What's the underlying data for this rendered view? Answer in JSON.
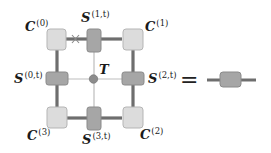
{
  "diagram": {
    "corners": [
      {
        "id": "C0",
        "base": "C",
        "sup": "(0)"
      },
      {
        "id": "C1",
        "base": "C",
        "sup": "(1)"
      },
      {
        "id": "C2",
        "base": "C",
        "sup": "(2)"
      },
      {
        "id": "C3",
        "base": "C",
        "sup": "(3)"
      }
    ],
    "edges": [
      {
        "id": "S0",
        "base": "S",
        "sup": "(0,t)"
      },
      {
        "id": "S1",
        "base": "S",
        "sup": "(1,t)"
      },
      {
        "id": "S2",
        "base": "S",
        "sup": "(2,t)"
      },
      {
        "id": "S3",
        "base": "S",
        "sup": "(3,t)"
      }
    ],
    "center": {
      "id": "T",
      "label": "T"
    },
    "equals": "=",
    "cross_mark": "×",
    "colors": {
      "corner_fill": "#dcdcdc",
      "corner_stroke": "#b5b5b5",
      "edge_fill": "#a6a6a6",
      "edge_stroke": "#8a8a8a",
      "thick_line": "#6e6e6e",
      "thin_line": "#bdbdbd",
      "center_dot": "#8c8c8c"
    }
  }
}
